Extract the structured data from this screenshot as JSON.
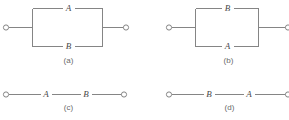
{
  "figure": {
    "line_color": "#858585",
    "label_color": "#4a4a4a",
    "caption_color": "#6a6a6a",
    "background_color": "#ffffff"
  },
  "panels": [
    {
      "id": "a",
      "caption": "(a)",
      "topology": "parallel",
      "top_label": "A",
      "bottom_label": "B"
    },
    {
      "id": "b",
      "caption": "(b)",
      "topology": "parallel",
      "top_label": "B",
      "bottom_label": "A"
    },
    {
      "id": "c",
      "caption": "(c)",
      "topology": "series",
      "first_label": "A",
      "second_label": "B"
    },
    {
      "id": "d",
      "caption": "(d)",
      "topology": "series",
      "first_label": "B",
      "second_label": "A"
    }
  ]
}
